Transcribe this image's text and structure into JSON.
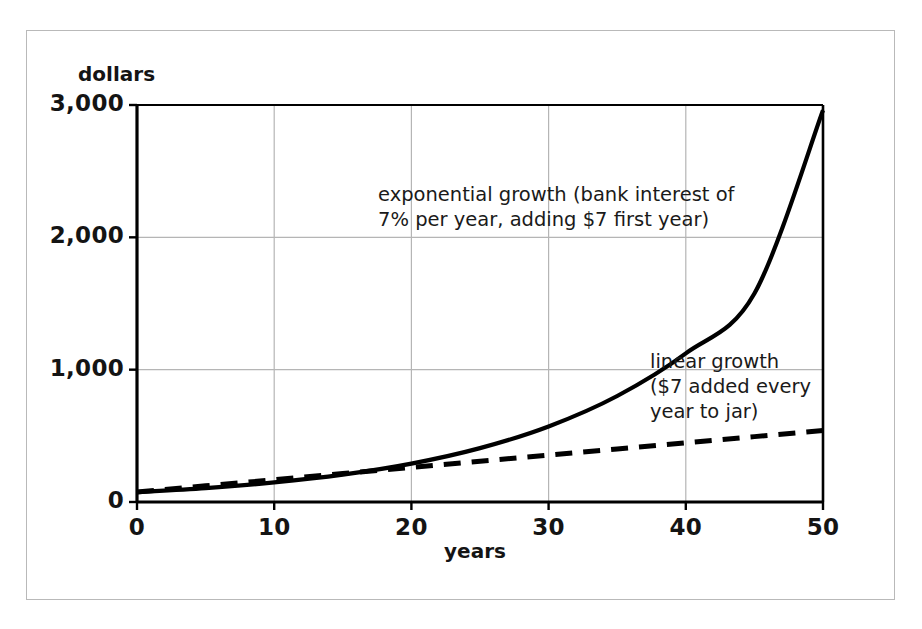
{
  "chart_data": {
    "type": "line",
    "title": "",
    "xlabel": "years",
    "ylabel": "dollars",
    "xlim": [
      0,
      50
    ],
    "ylim": [
      0,
      3000
    ],
    "grid": true,
    "legend_position": "inline-annotations",
    "x_ticks": [
      "0",
      "10",
      "20",
      "30",
      "40",
      "50"
    ],
    "x_tick_values": [
      0,
      10,
      20,
      30,
      40,
      50
    ],
    "y_ticks": [
      "0",
      "1,000",
      "2,000",
      "3,000"
    ],
    "y_tick_values": [
      0,
      1000,
      2000,
      3000
    ],
    "x": [
      0,
      5,
      10,
      15,
      20,
      25,
      30,
      35,
      40,
      45,
      50
    ],
    "series": [
      {
        "name": "exponential growth",
        "style": "solid",
        "color": "#000000",
        "annotation": "exponential growth (bank interest of\n7% per year, adding $7 first year)",
        "values": [
          75,
          105,
          148,
          207,
          290,
          407,
          571,
          801,
          1123,
          1575,
          2960
        ]
      },
      {
        "name": "linear growth",
        "style": "dashed",
        "color": "#000000",
        "annotation": "linear growth\n($7 added every\nyear to jar)",
        "values": [
          75,
          122,
          168,
          215,
          261,
          308,
          354,
          401,
          447,
          494,
          540
        ]
      }
    ]
  },
  "axes": {
    "y_title": "dollars",
    "x_title": "years",
    "y_tick_labels": [
      "3,000",
      "2,000",
      "1,000",
      "0"
    ],
    "x_tick_labels": [
      "0",
      "10",
      "20",
      "30",
      "40",
      "50"
    ]
  },
  "annotations": {
    "exponential": "exponential growth (bank interest of\n7% per year, adding $7 first year)",
    "linear": "linear growth\n($7 added every\nyear to jar)"
  },
  "colors": {
    "axis": "#000000",
    "grid": "#b5b5b5",
    "curve": "#000000",
    "frame": "#b9b9b9",
    "background": "#ffffff",
    "text": "#141414"
  }
}
